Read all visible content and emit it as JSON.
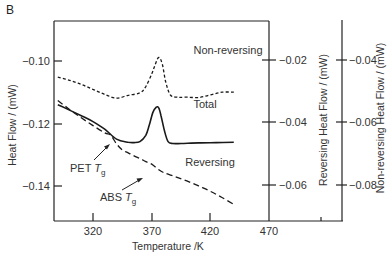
{
  "chart_data": {
    "type": "line",
    "panel_label": "B",
    "title": "",
    "xlabel": "Temperature /K",
    "xlim": [
      287,
      470
    ],
    "xticks": [
      320,
      370,
      420,
      470
    ],
    "y_axes": [
      {
        "id": "left",
        "label": "Heat Flow / (mW)",
        "ticks": [
          -0.1,
          -0.12,
          -0.14
        ],
        "tick_labels": [
          "−0.10",
          "−0.12",
          "−0.14"
        ],
        "ylim": [
          -0.113,
          -0.152
        ]
      },
      {
        "id": "right1",
        "label": "Reversing Heat Flow / (mW)",
        "ticks": [
          -0.02,
          -0.04,
          -0.06
        ],
        "tick_labels": [
          "−0.02",
          "−0.04",
          "−0.06"
        ]
      },
      {
        "id": "right2",
        "label": "Non-reversing Heat Flow / (mW)",
        "ticks": [
          -0.04,
          -0.06,
          -0.08
        ],
        "tick_labels": [
          "−0.04",
          "−0.06",
          "−0.08"
        ]
      }
    ],
    "grid": false,
    "legend": "inline annotations",
    "series": [
      {
        "name": "Non-reversing",
        "axis": "right2",
        "style": "dotted",
        "x": [
          290,
          300,
          310,
          320,
          330,
          340,
          350,
          360,
          365,
          370,
          373,
          376,
          379,
          382,
          386,
          392,
          400,
          410,
          420,
          430,
          440
        ],
        "values": [
          -0.0455,
          -0.0465,
          -0.0478,
          -0.0494,
          -0.051,
          -0.0522,
          -0.0513,
          -0.0505,
          -0.0485,
          -0.0445,
          -0.0415,
          -0.0392,
          -0.0412,
          -0.047,
          -0.0512,
          -0.0519,
          -0.0519,
          -0.052,
          -0.0512,
          -0.0503,
          -0.0503
        ]
      },
      {
        "name": "Total",
        "axis": "left",
        "style": "solid",
        "x": [
          290,
          300,
          310,
          320,
          330,
          340,
          350,
          355,
          360,
          365,
          368,
          371,
          374,
          376,
          378,
          381,
          384,
          388,
          395,
          410,
          425,
          440
        ],
        "values": [
          -0.114,
          -0.1157,
          -0.1175,
          -0.1194,
          -0.1218,
          -0.125,
          -0.126,
          -0.1261,
          -0.1258,
          -0.1238,
          -0.1205,
          -0.1165,
          -0.1148,
          -0.115,
          -0.1175,
          -0.1225,
          -0.1258,
          -0.1264,
          -0.1264,
          -0.1262,
          -0.1261,
          -0.126
        ]
      },
      {
        "name": "Reversing",
        "axis": "right1",
        "style": "dashed",
        "x": [
          290,
          300,
          310,
          320,
          330,
          335,
          340,
          345,
          350,
          355,
          360,
          365,
          370,
          375,
          380,
          390,
          400,
          410,
          420,
          430,
          440
        ],
        "values": [
          -0.033,
          -0.0358,
          -0.0385,
          -0.041,
          -0.0433,
          -0.044,
          -0.0468,
          -0.0488,
          -0.0497,
          -0.0507,
          -0.0515,
          -0.0525,
          -0.0533,
          -0.0548,
          -0.056,
          -0.0573,
          -0.0587,
          -0.0603,
          -0.062,
          -0.064,
          -0.0662
        ]
      }
    ],
    "annotations": [
      {
        "text": "Non-reversing",
        "x": 395,
        "y_px": 54
      },
      {
        "text": "Total",
        "x": 395,
        "y_px": 108
      },
      {
        "text": "Reversing",
        "x": 400,
        "y_px": 166
      },
      {
        "text": "PET T_g",
        "arrow_to_T": 340
      },
      {
        "text": "ABS T_g",
        "arrow_to_T": 363
      }
    ]
  },
  "labels": {
    "panel": "B",
    "xlabel": "Temperature /K",
    "ylabel_left": "Heat Flow / (mW)",
    "ylabel_right1": "Reversing Heat Flow / (mW)",
    "ylabel_right2": "Non-reversing Heat Flow / (mW)",
    "series_nonrev": "Non-reversing",
    "series_total": "Total",
    "series_rev": "Reversing",
    "pet_main": "PET ",
    "abs_main": "ABS ",
    "tg_T": "T",
    "tg_sub": "g",
    "xt0": "320",
    "xt1": "370",
    "xt2": "420",
    "xt3": "470",
    "yl0": "−0.10",
    "yl1": "−0.12",
    "yl2": "−0.14",
    "yr0": "−0.02",
    "yr1": "−0.04",
    "yr2": "−0.06",
    "yn0": "−0.04",
    "yn1": "−0.06",
    "yn2": "−0.08"
  }
}
